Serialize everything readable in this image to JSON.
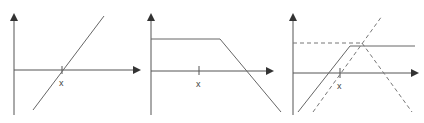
{
  "colors": {
    "line": "#555555",
    "axis": "#444444",
    "background": "#ffffff"
  },
  "panels": [
    {
      "id": "panel-1",
      "x_label": "x",
      "description": "straight line rising through x"
    },
    {
      "id": "panel-2",
      "x_label": "x",
      "description": "flat line then descending"
    },
    {
      "id": "panel-3",
      "x_label": "x",
      "description": "solid kinked line with dashed components"
    }
  ]
}
